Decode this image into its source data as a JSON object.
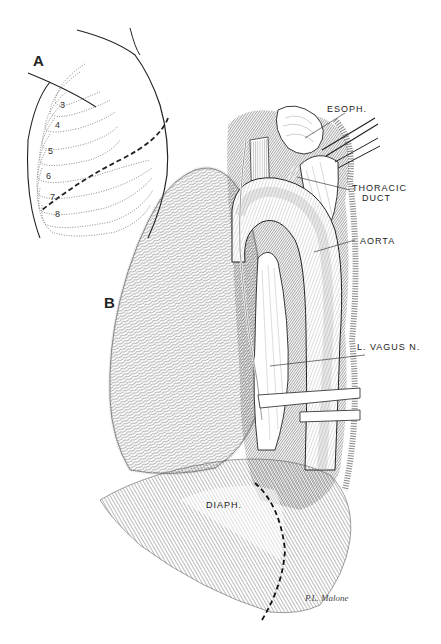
{
  "figure": {
    "panels": [
      {
        "id": "A",
        "label": "A",
        "description": "Chest wall outline with rib numbering and incision line",
        "rib_numbers": [
          "3",
          "4",
          "5",
          "6",
          "7",
          "8"
        ]
      },
      {
        "id": "B",
        "label": "B",
        "description": "Left thoracotomy exposure of thoracic aorta and esophagus"
      }
    ],
    "annotations": [
      {
        "text": "ESOPH.",
        "line1": "ESOPH."
      },
      {
        "text": "THORACIC DUCT",
        "line1": "THORACIC",
        "line2": "DUCT"
      },
      {
        "text": "AORTA",
        "line1": "AORTA"
      },
      {
        "text": "L. VAGUS N.",
        "line1": "L. VAGUS N."
      },
      {
        "text": "DIAPH.",
        "line1": "DIAPH."
      }
    ],
    "signature": "P.L. Malone"
  },
  "colors": {
    "ink": "#222222",
    "background": "#ffffff",
    "hatch": "#555555",
    "light_hatch": "#999999"
  }
}
